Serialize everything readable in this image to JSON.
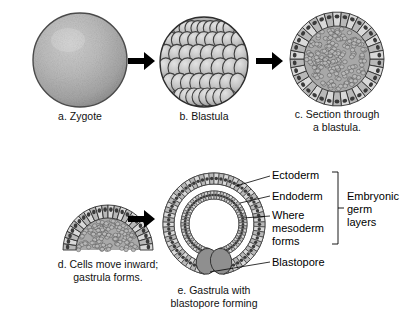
{
  "figure": {
    "background": "#ffffff",
    "ink": "#000000",
    "cell_fill_light": "#d9d9d9",
    "cell_fill_mid": "#b8b8b8",
    "cell_fill_dark": "#8f8f8f",
    "nucleus": "#3a3a3a"
  },
  "panels": {
    "a": {
      "key": "a",
      "caption": "a. Zygote",
      "name": "zygote"
    },
    "b": {
      "key": "b",
      "caption": "b. Blastula",
      "name": "blastula"
    },
    "c": {
      "key": "c",
      "caption": "c. Section through\na blastula.",
      "name": "blastula-section"
    },
    "d": {
      "key": "d",
      "caption": "d. Cells move inward;\ngastrula forms.",
      "name": "early-gastrula"
    },
    "e": {
      "key": "e",
      "caption": "e. Gastrula with\nblastopore forming",
      "name": "gastrula"
    }
  },
  "arrows": {
    "a_to_b": "→",
    "b_to_c": "→",
    "d_to_e": "→"
  },
  "labels": {
    "ectoderm": "Ectoderm",
    "endoderm": "Endoderm",
    "mesoderm": "Where\nmesoderm\nforms",
    "blastopore": "Blastopore",
    "germ_layers": "Embryonic\ngerm\nlayers"
  }
}
